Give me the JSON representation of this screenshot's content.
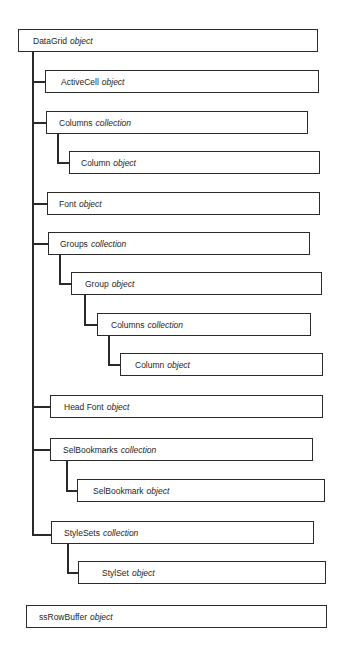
{
  "diagram": {
    "type": "object-hierarchy",
    "colors": {
      "line": "#2a2a2a",
      "text": "#1e1e1e",
      "background": "#ffffff"
    },
    "nodes": [
      {
        "id": "datagrid",
        "name": "DataGrid",
        "kind": "object",
        "level": 0
      },
      {
        "id": "activecell",
        "name": "ActiveCell",
        "kind": "object",
        "level": 1,
        "parent": "datagrid"
      },
      {
        "id": "columns",
        "name": "Columns",
        "kind": "collection",
        "level": 1,
        "parent": "datagrid"
      },
      {
        "id": "column",
        "name": "Column",
        "kind": "object",
        "level": 2,
        "parent": "columns"
      },
      {
        "id": "font",
        "name": "Font",
        "kind": "object",
        "level": 1,
        "parent": "datagrid"
      },
      {
        "id": "groups",
        "name": "Groups",
        "kind": "collection",
        "level": 1,
        "parent": "datagrid"
      },
      {
        "id": "group",
        "name": "Group",
        "kind": "object",
        "level": 2,
        "parent": "groups"
      },
      {
        "id": "group-columns",
        "name": "Columns",
        "kind": "collection",
        "level": 3,
        "parent": "group"
      },
      {
        "id": "group-column",
        "name": "Column",
        "kind": "object",
        "level": 4,
        "parent": "group-columns"
      },
      {
        "id": "headfont",
        "name": "Head Font",
        "kind": "object",
        "level": 1,
        "parent": "datagrid"
      },
      {
        "id": "selbookmarks",
        "name": "SelBookmarks",
        "kind": "collection",
        "level": 1,
        "parent": "datagrid"
      },
      {
        "id": "selbookmark",
        "name": "SelBookmark",
        "kind": "object",
        "level": 2,
        "parent": "selbookmarks"
      },
      {
        "id": "stylesets",
        "name": "StyleSets",
        "kind": "collection",
        "level": 1,
        "parent": "datagrid"
      },
      {
        "id": "stylset",
        "name": "StylSet",
        "kind": "object",
        "level": 2,
        "parent": "stylesets"
      },
      {
        "id": "ssrowbuffer",
        "name": "ssRowBuffer",
        "kind": "object",
        "level": 0
      }
    ]
  }
}
